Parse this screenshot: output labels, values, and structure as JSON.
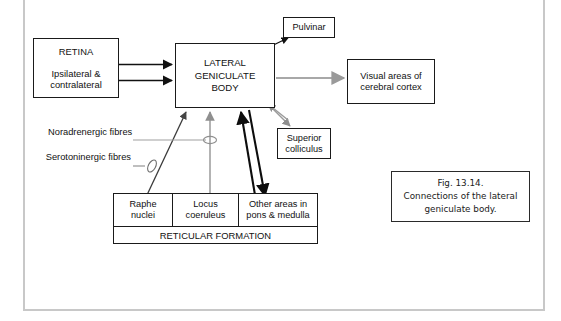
{
  "figure": {
    "frame_color": "#c8c8c8",
    "background": "#ffffff",
    "line_color_dark": "#1a1a1a",
    "line_color_gray": "#9a9a9a"
  },
  "nodes": {
    "retina": {
      "title": "RETINA",
      "line1": "Ipsilateral &",
      "line2": "contralateral"
    },
    "lgb": {
      "line1": "LATERAL",
      "line2": "GENICULATE",
      "line3": "BODY"
    },
    "pulvinar": {
      "label": "Pulvinar"
    },
    "visual_cortex": {
      "line1": "Visual areas of",
      "line2": "cerebral cortex"
    },
    "superior_colliculus": {
      "line1": "Superior",
      "line2": "colliculus"
    }
  },
  "reticular_formation": {
    "footer_label": "RETICULAR FORMATION",
    "cells": [
      {
        "line1": "Raphe",
        "line2": "nuclei"
      },
      {
        "line1": "Locus",
        "line2": "coeruleus"
      },
      {
        "line1": "Other areas in",
        "line2": "pons & medulla"
      }
    ]
  },
  "fibre_labels": {
    "noradrenergic": {
      "line1": "Noradrenergic",
      "line2": "fibres"
    },
    "serotoninergic": {
      "line1": "Serotoninergic",
      "line2": "fibres"
    }
  },
  "caption": {
    "line1": "Fig. 13.14.",
    "line2": "Connections of the lateral",
    "line3": "geniculate body."
  },
  "connections": [
    {
      "name": "retina-to-lgb-upper",
      "from": "retina",
      "to": "lgb",
      "style": "solid-black-arrow"
    },
    {
      "name": "retina-to-lgb-lower",
      "from": "retina",
      "to": "lgb",
      "style": "solid-black-arrow"
    },
    {
      "name": "lgb-to-pulvinar",
      "from": "lgb",
      "to": "pulvinar",
      "style": "thin-black-arrow"
    },
    {
      "name": "lgb-to-visual-cortex",
      "from": "lgb",
      "to": "visual_cortex",
      "style": "gray-arrow"
    },
    {
      "name": "lgb-to-superior-colliculus",
      "from": "lgb",
      "to": "superior_colliculus",
      "style": "gray-arrow"
    },
    {
      "name": "superior-colliculus-to-lgb",
      "from": "superior_colliculus",
      "to": "lgb",
      "style": "gray-arrow"
    },
    {
      "name": "raphe-nuclei-to-lgb",
      "from": "raphe_nuclei",
      "to": "lgb",
      "style": "thin-dark-arrow"
    },
    {
      "name": "locus-coeruleus-to-lgb",
      "from": "locus_coeruleus",
      "to": "lgb",
      "style": "gray-arrow"
    },
    {
      "name": "other-areas-to-lgb",
      "from": "other_areas",
      "to": "lgb",
      "style": "thick-black-arrow"
    },
    {
      "name": "lgb-to-other-areas",
      "from": "lgb",
      "to": "other_areas",
      "style": "thick-black-arrow"
    }
  ]
}
